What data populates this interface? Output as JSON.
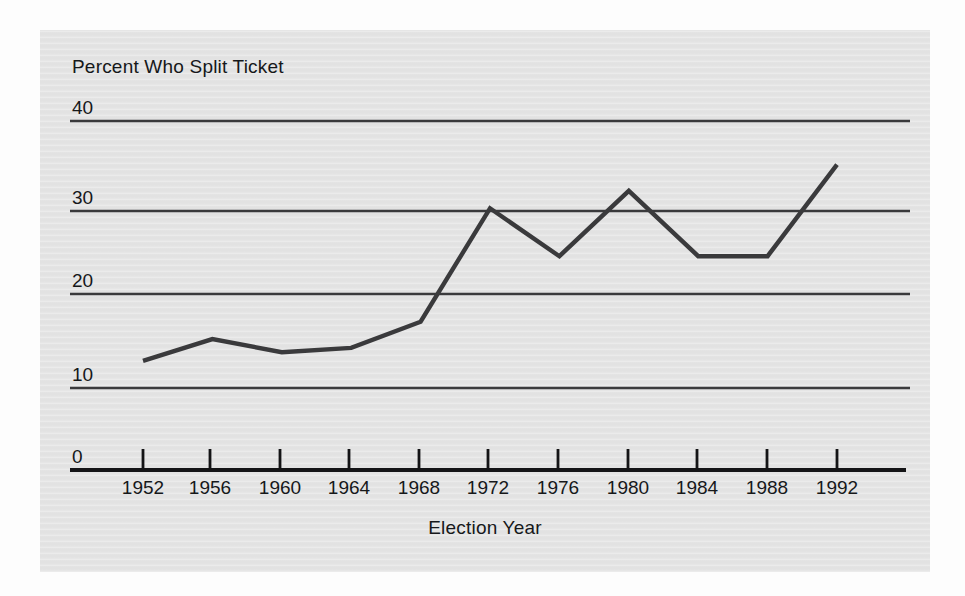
{
  "chart_data": {
    "type": "line",
    "title": "",
    "ylabel": "Percent Who Split Ticket",
    "xlabel": "Election Year",
    "categories": [
      "1952",
      "1956",
      "1960",
      "1964",
      "1968",
      "1972",
      "1976",
      "1980",
      "1984",
      "1988",
      "1992"
    ],
    "x": [
      1952,
      1956,
      1960,
      1964,
      1968,
      1972,
      1976,
      1980,
      1984,
      1988,
      1992
    ],
    "values": [
      12.5,
      15,
      13.5,
      14,
      17,
      30,
      24.5,
      32,
      24.5,
      24.5,
      35
    ],
    "series": [
      {
        "name": "Percent Who Split Ticket",
        "values": [
          12.5,
          15,
          13.5,
          14,
          17,
          30,
          24.5,
          32,
          24.5,
          24.5,
          35
        ]
      }
    ],
    "ylim": [
      0,
      40
    ],
    "xlim": [
      1952,
      1992
    ],
    "yticks": [
      0,
      10,
      20,
      30,
      40
    ],
    "ytick_labels": [
      "0",
      "10",
      "20",
      "30",
      "40"
    ],
    "xtick_labels": [
      "1952",
      "1956",
      "1960",
      "1964",
      "1968",
      "1972",
      "1976",
      "1980",
      "1984",
      "1988",
      "1992"
    ],
    "grid": true,
    "grid_axis": "y",
    "legend": false,
    "legend_position": "none",
    "line_color": "#3a3a3c",
    "grid_color": "#3a3a3c",
    "panel_color": "#e4e4e4",
    "text_color": "#16181a"
  },
  "axes": {
    "y_axis_title": "Percent Who Split Ticket",
    "x_axis_title": "Election Year",
    "y_labels": [
      "40",
      "30",
      "20",
      "10",
      "0"
    ],
    "x_labels": [
      "1952",
      "1956",
      "1960",
      "1964",
      "1968",
      "1972",
      "1976",
      "1980",
      "1984",
      "1988",
      "1992"
    ]
  }
}
